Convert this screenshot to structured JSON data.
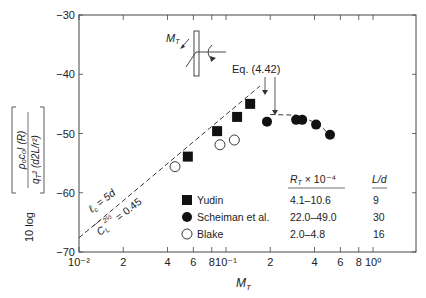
{
  "chart_data": {
    "type": "scatter",
    "title": "",
    "xlabel": "M_T",
    "ylabel": "10 log [ ρ0c0 I(R) / qT^2 (d2L/r^2) ]",
    "xscale": "log",
    "xlim": [
      0.01,
      1.3
    ],
    "ylim": [
      -70,
      -30
    ],
    "x_ticks_major": [
      "10^-2",
      "10^-1",
      "10^0"
    ],
    "x_tick_labels": [
      "10⁻²",
      "2",
      "4",
      "6",
      "8",
      "10⁻¹",
      "2",
      "4",
      "6",
      "8",
      "10⁰"
    ],
    "x_tick_values": [
      0.01,
      0.02,
      0.04,
      0.06,
      0.08,
      0.1,
      0.2,
      0.4,
      0.6,
      0.8,
      1.0
    ],
    "y_tick_labels": [
      "−30",
      "−40",
      "−50",
      "−60",
      "−70"
    ],
    "y_tick_values": [
      -30,
      -40,
      -50,
      -60,
      -70
    ],
    "grid": false,
    "series": [
      {
        "name": "Yudin",
        "marker": "filled-square",
        "R_T_range": "4.1–10.6",
        "L_d": "9",
        "x": [
          0.055,
          0.087,
          0.119,
          0.146
        ],
        "y": [
          -53.9,
          -49.6,
          -47.2,
          -45.0
        ]
      },
      {
        "name": "Scheiman et al.",
        "marker": "filled-circle",
        "R_T_range": "22.0–49.0",
        "L_d": "30",
        "x": [
          0.19,
          0.3,
          0.33,
          0.41,
          0.51
        ],
        "y": [
          -48.0,
          -47.7,
          -47.7,
          -48.5,
          -50.2
        ]
      },
      {
        "name": "Blake",
        "marker": "open-circle",
        "R_T_range": "2.0–4.8",
        "L_d": "16",
        "x": [
          0.045,
          0.091,
          0.114
        ],
        "y": [
          -55.6,
          -51.9,
          -51.1
        ]
      }
    ],
    "fit_lines": [
      {
        "name": "linear-trend",
        "style": "dashed",
        "x": [
          0.01,
          0.17
        ],
        "y": [
          -67.6,
          -42.0
        ],
        "annotation_1": "ℓc = 5d",
        "annotation_2": "C̄L^(2½) = 0.45"
      },
      {
        "name": "peak-curve",
        "style": "dashed",
        "x": [
          0.2,
          0.3,
          0.42,
          0.55
        ],
        "y": [
          -46.8,
          -46.9,
          -48.3,
          -51.0
        ]
      }
    ],
    "annotations": [
      "Eq. (4.42)",
      "M_T"
    ],
    "legend": {
      "position": "lower-right",
      "header_rt": "R_T × 10⁻⁴",
      "header_ld": "L/d"
    }
  },
  "labels": {
    "eq": "Eq. (4.42)",
    "mt_diagram": "M",
    "mt_sub": "T",
    "lc": "ℓ",
    "lc_sub": "c",
    "lc_rest": " = 5d",
    "cl": "C",
    "cl_sub": "L",
    "cl_sup": "2½",
    "cl_rest": " = 0.45",
    "xlabel_main": "M",
    "xlabel_sub": "T",
    "ylabel_prefix": "10 log",
    "ylabel_num": "ρ₀c₀I (R)",
    "ylabel_den": "q",
    "ylabel_den_sub": "T",
    "ylabel_den_rest": "² (d2L/r²)",
    "legend_rt_main": "R",
    "legend_rt_sub": "T",
    "legend_rt_rest": " × 10⁻⁴",
    "legend_ld": "L/d",
    "legend_rows": [
      {
        "name": "Yudin",
        "rt": "4.1–10.6",
        "ld": "9"
      },
      {
        "name": "Scheiman et al.",
        "rt": "22.0–49.0",
        "ld": "30"
      },
      {
        "name": "Blake",
        "rt": "2.0–4.8",
        "ld": "16"
      }
    ]
  }
}
